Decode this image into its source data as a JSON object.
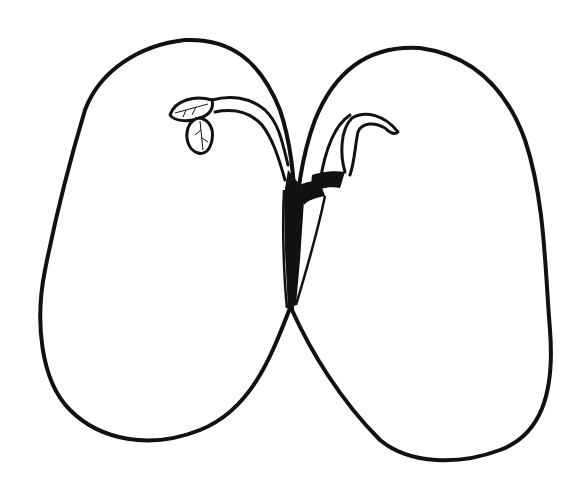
{
  "diagram": {
    "stroke_color": "#111111",
    "background": "#ffffff",
    "parts": [
      {
        "id": "left-cotyledon",
        "label": ""
      },
      {
        "id": "right-cotyledon",
        "label": ""
      },
      {
        "id": "plumule-leaves",
        "label": ""
      },
      {
        "id": "hypocotyl",
        "label": ""
      },
      {
        "id": "radicle",
        "label": ""
      }
    ]
  }
}
